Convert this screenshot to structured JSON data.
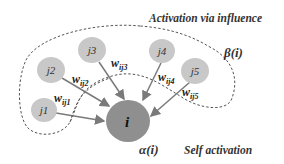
{
  "title": "Activation via influence",
  "beta_label": "β(i)",
  "alpha_label": "α(i)",
  "self_label": "Self activation",
  "center_node": {
    "id": "i",
    "label": "i",
    "color": "#8f8f8f"
  },
  "neighbor_color": "#c8c8c8",
  "edge_color": "#7a7a7a",
  "neighbors": [
    {
      "id": "j1",
      "label": "j1",
      "weight": "w",
      "weight_sub": "ij1"
    },
    {
      "id": "j2",
      "label": "j2",
      "weight": "w",
      "weight_sub": "ij2"
    },
    {
      "id": "j3",
      "label": "j3",
      "weight": "w",
      "weight_sub": "ij3"
    },
    {
      "id": "j4",
      "label": "j4",
      "weight": "w",
      "weight_sub": "ij4"
    },
    {
      "id": "j5",
      "label": "j5",
      "weight": "w",
      "weight_sub": "ij5"
    }
  ]
}
